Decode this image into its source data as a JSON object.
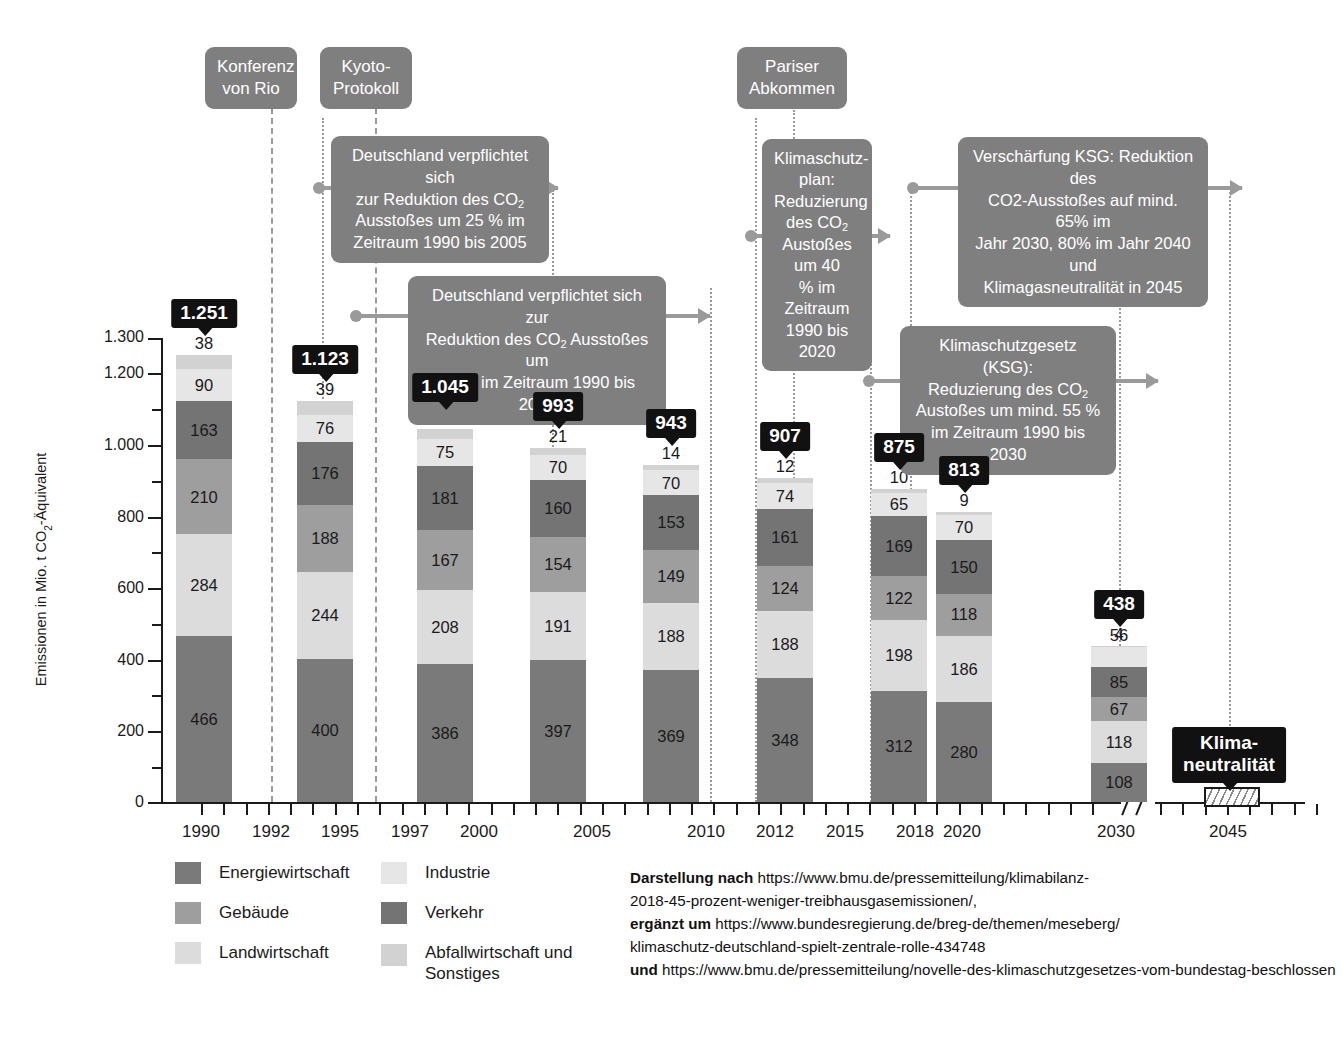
{
  "chart_data": {
    "type": "bar",
    "title": "",
    "xlabel": "",
    "ylabel": "Emissionen in Mio. t CO2-Äquivalent",
    "ylim": [
      0,
      1300
    ],
    "ytick_labels": [
      "0",
      "200",
      "400",
      "600",
      "800",
      "1.000",
      "1.200",
      "1.300"
    ],
    "ytick_values": [
      0,
      200,
      400,
      600,
      800,
      1000,
      1200,
      1300
    ],
    "grid": false,
    "legend_position": "bottom-left",
    "stacked": true,
    "series_order": [
      "Energiewirtschaft",
      "Landwirtschaft",
      "Gebäude",
      "Verkehr",
      "Industrie",
      "Abfallwirtschaft und Sonstiges"
    ],
    "categories": [
      "1990",
      "1995",
      "2000",
      "2005",
      "2010",
      "2015",
      "2018",
      "2020",
      "2030",
      "2045"
    ],
    "axis_year_labels": [
      "1990",
      "1992",
      "1995",
      "1997",
      "2000",
      "2005",
      "2010",
      "2012",
      "2015",
      "2018",
      "2020",
      "2030",
      "2045"
    ],
    "totals": [
      1251,
      1123,
      1045,
      993,
      943,
      907,
      875,
      813,
      438,
      null
    ],
    "total_labels": [
      "1.251",
      "1.123",
      "1.045",
      "993",
      "943",
      "907",
      "875",
      "813",
      "438",
      "Klima-\nneutralität"
    ],
    "bars": [
      {
        "year": "1990",
        "total": "1.251",
        "segments": [
          466,
          284,
          210,
          163,
          90,
          38
        ]
      },
      {
        "year": "1995",
        "total": "1.123",
        "segments": [
          400,
          244,
          188,
          176,
          76,
          39
        ]
      },
      {
        "year": "2000",
        "total": "1.045",
        "segments": [
          386,
          208,
          167,
          181,
          75,
          28
        ]
      },
      {
        "year": "2005",
        "total": "993",
        "segments": [
          397,
          191,
          154,
          160,
          70,
          21
        ]
      },
      {
        "year": "2010",
        "total": "943",
        "segments": [
          369,
          188,
          149,
          153,
          70,
          14
        ]
      },
      {
        "year": "2015",
        "total": "907",
        "segments": [
          348,
          188,
          124,
          161,
          74,
          12
        ]
      },
      {
        "year": "2018",
        "total": "875",
        "segments": [
          312,
          198,
          122,
          169,
          65,
          10
        ]
      },
      {
        "year": "2020",
        "total": "813",
        "segments": [
          280,
          186,
          118,
          150,
          70,
          9
        ]
      },
      {
        "year": "2030",
        "total": "438",
        "segments": [
          108,
          118,
          67,
          85,
          56,
          4
        ]
      }
    ],
    "neutrality_label": "Klima-\nneutralität",
    "neutrality_year": "2045"
  },
  "legend": {
    "items": [
      {
        "label": "Energiewirtschaft",
        "color": "#7a7a7a"
      },
      {
        "label": "Gebäude",
        "color": "#9e9e9e"
      },
      {
        "label": "Landwirtschaft",
        "color": "#dcdcdc"
      },
      {
        "label": "Industrie",
        "color": "#e6e6e6"
      },
      {
        "label": "Verkehr",
        "color": "#747474"
      },
      {
        "label": "Abfallwirtschaft und Sonstiges",
        "color": "#d2d2d2"
      }
    ]
  },
  "callouts": [
    {
      "id": "konferenz-von-rio",
      "text": "Konferenz\nvon Rio"
    },
    {
      "id": "kyoto-protokoll",
      "text": "Kyoto-\nProtokoll"
    },
    {
      "id": "pariser-abkommen",
      "text": "Pariser\nAbkommen"
    },
    {
      "id": "reduktion-25",
      "text": "Deutschland verpflichtet sich\nzur Reduktion des CO2\nAusstoßes um 25 % im\nZeitraum 1990 bis 2005"
    },
    {
      "id": "reduktion-21",
      "text": "Deutschland verpflichtet sich zur\nReduktion des CO2 Ausstoßes um\n21 % im Zeitraum 1990 bis 2012"
    },
    {
      "id": "klimaschutzplan",
      "text": "Klimaschutz-\nplan:\nReduzierung\ndes CO2\nAustoßes um 40\n% im Zeitraum\n1990 bis  2020"
    },
    {
      "id": "ksg",
      "text": "Klimaschutzgesetz (KSG):\nReduzierung des CO2\nAustoßes um mind. 55 %\nim Zeitraum 1990 bis 2030"
    },
    {
      "id": "verschaerfung-ksg",
      "text": "Verschärfung KSG: Reduktion des\nCO2-Ausstoßes auf mind. 65% im\nJahr 2030, 80% im Jahr 2040 und\nKlimagasneutralität in 2045"
    }
  ],
  "callout_text": {
    "rio_l1": "Konferenz",
    "rio_l2": "von Rio",
    "kyoto_l1": "Kyoto-",
    "kyoto_l2": "Protokoll",
    "paris_l1": "Pariser",
    "paris_l2": "Abkommen",
    "r25_l1": "Deutschland verpflichtet sich",
    "r25_l2a": "zur Reduktion des CO",
    "r25_l2b": "2",
    "r25_l3": "Ausstoßes um 25 % im",
    "r25_l4": "Zeitraum 1990 bis 2005",
    "r21_l1": "Deutschland verpflichtet sich zur",
    "r21_l2a": "Reduktion des CO",
    "r21_l2b": "2",
    "r21_l2c": " Ausstoßes um",
    "r21_l3": "21 % im Zeitraum 1990 bis 2012",
    "ksp_l1": "Klimaschutz-",
    "ksp_l2": "plan:",
    "ksp_l3": "Reduzierung",
    "ksp_l4a": "des CO",
    "ksp_l4b": "2",
    "ksp_l5": "Austoßes um 40",
    "ksp_l6": "% im Zeitraum",
    "ksp_l7": "1990 bis  2020",
    "ksg_l1": "Klimaschutzgesetz (KSG):",
    "ksg_l2a": "Reduzierung des CO",
    "ksg_l2b": "2",
    "ksg_l3": "Austoßes um mind. 55 %",
    "ksg_l4": "im Zeitraum 1990 bis 2030",
    "vks_l1": "Verschärfung KSG: Reduktion des",
    "vks_l2": "CO2-Ausstoßes auf mind. 65% im",
    "vks_l3": "Jahr 2030, 80% im Jahr 2040 und",
    "vks_l4": "Klimagasneutralität in 2045",
    "neutral_l1": "Klima-",
    "neutral_l2": "neutralität"
  },
  "axis": {
    "y_title_a": "Emissionen in Mio. t CO",
    "y_title_b": "2",
    "y_title_c": "-Äquivalent",
    "y_labels": [
      "1.300",
      "1.200",
      "1.000",
      "800",
      "600",
      "400",
      "200",
      "0"
    ],
    "x_labels": [
      "1990",
      "1992",
      "1995",
      "1997",
      "2000",
      "2005",
      "2010",
      "2012",
      "2015",
      "2018",
      "2020",
      "2030",
      "2045"
    ]
  },
  "source": {
    "l1_bold": "Darstellung nach ",
    "l1": "https://www.bmu.de/pressemitteilung/klimabilanz-",
    "l2": "2018-45-prozent-weniger-treibhausgasemissionen/,",
    "l3_bold": "ergänzt um ",
    "l3": "https://www.bundesregierung.de/breg-de/themen/meseberg/",
    "l4": "klimaschutz-deutschland-spielt-zentrale-rolle-434748",
    "l5_bold": "und ",
    "l5": "https://www.bmu.de/pressemitteilung/novelle-des-klimaschutzgesetzes-vom-bundestag-beschlossen"
  }
}
